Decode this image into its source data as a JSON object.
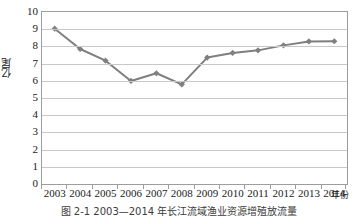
{
  "chart_data": {
    "type": "line",
    "title": "",
    "xlabel": "年份",
    "ylabel": "亿尾",
    "categories": [
      "2003",
      "2004",
      "2005",
      "2006",
      "2007",
      "2008",
      "2009",
      "2010",
      "2011",
      "2012",
      "2013",
      "2014"
    ],
    "values": [
      9.03,
      7.85,
      7.17,
      5.99,
      6.44,
      5.79,
      7.35,
      7.62,
      7.77,
      8.06,
      8.29,
      8.3
    ],
    "series": [
      {
        "name": "投放量",
        "values": [
          9.03,
          7.85,
          7.17,
          5.99,
          6.44,
          5.79,
          7.35,
          7.62,
          7.77,
          8.06,
          8.29,
          8.3
        ]
      }
    ],
    "ylim": [
      0,
      10
    ],
    "y_ticks": [
      "0",
      "1",
      "2",
      "3",
      "4",
      "5",
      "6",
      "7",
      "8",
      "9",
      "10"
    ],
    "y_tick_step": 1,
    "grid": "horizontal",
    "legend": "none",
    "marker": "diamond",
    "line_color": "#7f7f7f",
    "marker_color": "#7f7f7f",
    "grid_color": "#c8c8c8",
    "frame_color": "#9d9d9d",
    "text_color": "#1a1a1a"
  },
  "caption": {
    "text": "图 2-1  2003—2014 年长江流域渔业资源增殖放流量"
  }
}
